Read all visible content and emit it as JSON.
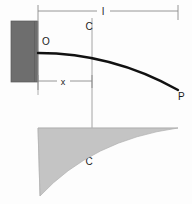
{
  "figure": {
    "type": "engineering-diagram",
    "background_color": "#fdfdfd"
  },
  "labels": {
    "span_length": "l",
    "distance_x": "x",
    "origin_point": "O",
    "load_point": "P",
    "section_top": "C",
    "section_bottom": "C"
  },
  "colors": {
    "wall_fill": "#6e6e6e",
    "wall_stroke": "#4f4f4f",
    "beam_curve": "#111111",
    "moment_fill": "#c4c4c4",
    "moment_stroke": "#a8a8a8",
    "dimension_line": "#8a8a8a",
    "section_line": "#9a9a9a",
    "text": "#1a1a1a"
  },
  "geometry": {
    "wall": {
      "x": 11,
      "y": 21,
      "width": 27,
      "height": 61
    },
    "beam": {
      "origin": {
        "x": 38,
        "y": 53
      },
      "tip": {
        "x": 178,
        "y": 90
      },
      "control": {
        "x": 110,
        "y": 55
      },
      "stroke_width": 2.4
    },
    "dimension_l": {
      "y": 11,
      "x_start": 38,
      "x_end": 178,
      "label_x": 103,
      "label_y": 14
    },
    "dimension_x": {
      "y": 81,
      "x_start": 38,
      "x_end": 92,
      "label_x": 63,
      "label_y": 85
    },
    "section_line": {
      "x": 92,
      "y_top": 18,
      "y_bottom": 155
    },
    "moment_diagram": {
      "left": 38,
      "right": 178,
      "top": 128,
      "bottom_left": 196,
      "curve_control": {
        "x": 120,
        "y": 150
      }
    }
  },
  "annotations": {
    "origin_label_pos": {
      "x": 42,
      "y": 45
    },
    "load_label_pos": {
      "x": 179,
      "y": 99
    },
    "section_top_label_pos": {
      "x": 89,
      "y": 30
    },
    "section_bottom_label_pos": {
      "x": 89,
      "y": 164
    }
  }
}
